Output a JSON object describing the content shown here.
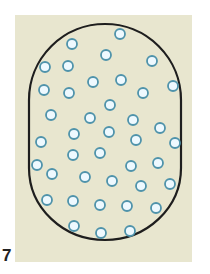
{
  "figure": {
    "label": "7",
    "background_color": "#e8e6cf",
    "outline_color": "#1e1e1e",
    "particle_ring_color": "#4f93ab",
    "particle_fill_color": "#eef9ff",
    "container_shape": "stadium (rounded rectangle with semicircular ends)",
    "particle_count": 45,
    "particles": [
      [
        120,
        34
      ],
      [
        72,
        44
      ],
      [
        106,
        55
      ],
      [
        152,
        61
      ],
      [
        45,
        67
      ],
      [
        68,
        66
      ],
      [
        93,
        82
      ],
      [
        121,
        80
      ],
      [
        173,
        86
      ],
      [
        44,
        90
      ],
      [
        69,
        93
      ],
      [
        143,
        93
      ],
      [
        110,
        105
      ],
      [
        51,
        115
      ],
      [
        90,
        118
      ],
      [
        133,
        120
      ],
      [
        160,
        128
      ],
      [
        74,
        134
      ],
      [
        109,
        132
      ],
      [
        136,
        140
      ],
      [
        41,
        142
      ],
      [
        175,
        143
      ],
      [
        73,
        155
      ],
      [
        100,
        153
      ],
      [
        37,
        165
      ],
      [
        131,
        166
      ],
      [
        158,
        163
      ],
      [
        52,
        174
      ],
      [
        85,
        177
      ],
      [
        112,
        181
      ],
      [
        141,
        186
      ],
      [
        170,
        184
      ],
      [
        47,
        200
      ],
      [
        73,
        201
      ],
      [
        100,
        205
      ],
      [
        127,
        206
      ],
      [
        156,
        208
      ],
      [
        74,
        226
      ],
      [
        101,
        233
      ],
      [
        130,
        231
      ]
    ]
  }
}
